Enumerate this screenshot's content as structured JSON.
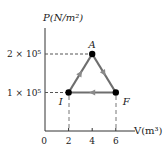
{
  "diagram": {
    "y_axis_label": "P(N/m²)",
    "x_axis_label": "V(m³)",
    "origin_label": "0",
    "x_ticks": [
      "2",
      "4",
      "6"
    ],
    "y_ticks": [
      "1 × 10⁵",
      "2 × 10⁵"
    ],
    "points": [
      {
        "label": "A",
        "V": 4,
        "P": 200000
      },
      {
        "label": "I",
        "V": 2,
        "P": 100000
      },
      {
        "label": "F",
        "V": 6,
        "P": 100000
      }
    ],
    "path": [
      "I",
      "A",
      "F",
      "I"
    ],
    "colors": {
      "path": "#6e6e6e",
      "point": "#000000",
      "axis": "#333333"
    }
  }
}
